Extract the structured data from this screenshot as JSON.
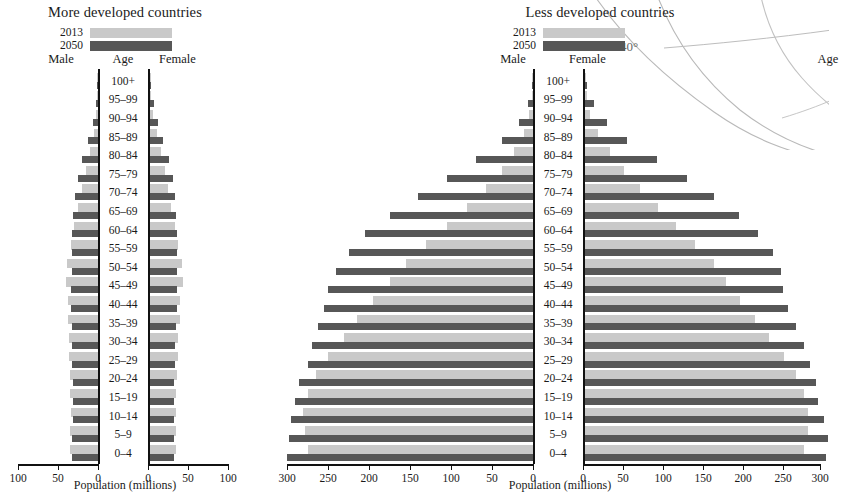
{
  "figure": {
    "panels": [
      {
        "id": "more-developed",
        "title": "More developed countries",
        "legend": [
          {
            "label": "2013",
            "color": "#c9c9c9"
          },
          {
            "label": "2050",
            "color": "#575757"
          }
        ],
        "col_headers": {
          "male": "Male",
          "age": "Age",
          "female": "Female"
        },
        "axis_title": "Population (millions)",
        "ticks": [
          "100",
          "50",
          "0"
        ],
        "ticks_right": [
          "0",
          "50",
          "100"
        ],
        "axis_max": 100
      },
      {
        "id": "less-developed",
        "title": "Less developed countries",
        "legend": [
          {
            "label": "2013",
            "color": "#c9c9c9"
          },
          {
            "label": "2050",
            "color": "#575757"
          }
        ],
        "col_headers": {
          "male": "Male",
          "age": "Age",
          "female": "Female"
        },
        "axis_title": "Population (millions)",
        "ticks": [
          "300",
          "250",
          "200",
          "150",
          "100",
          "50",
          "0"
        ],
        "ticks_right": [
          "0",
          "50",
          "100",
          "150",
          "200",
          "250",
          "300"
        ],
        "axis_max": 300
      }
    ],
    "map_annotation": {
      "label": "40°"
    }
  },
  "chart_data": [
    {
      "type": "bar",
      "id": "more-developed",
      "title": "More developed countries",
      "subtype": "population-pyramid",
      "xlabel": "Population (millions)",
      "ylabel": "Age",
      "xlim": [
        0,
        100
      ],
      "xticks": [
        0,
        50,
        100
      ],
      "grid": false,
      "legend": [
        "2013",
        "2050"
      ],
      "legend_position": "top-left",
      "categories": [
        "100+",
        "95–99",
        "90–94",
        "85–89",
        "80–84",
        "75–79",
        "70–74",
        "65–69",
        "60–64",
        "55–59",
        "50–54",
        "45–49",
        "40–44",
        "35–39",
        "30–34",
        "25–29",
        "20–24",
        "15–19",
        "10–14",
        "5–9",
        "0–4"
      ],
      "series": [
        {
          "name": "Male 2013",
          "side": "left",
          "year": 2013,
          "values": [
            0.1,
            0.7,
            2.2,
            5.2,
            10.5,
            15.5,
            19.5,
            24.5,
            29.5,
            33.5,
            38.5,
            40.5,
            37.5,
            37.0,
            36.0,
            36.5,
            35.0,
            34.5,
            34.0,
            34.5,
            34.5
          ]
        },
        {
          "name": "Male 2050",
          "side": "left",
          "year": 2050,
          "values": [
            0.8,
            2.6,
            6.5,
            12.5,
            19.5,
            25.5,
            29.0,
            31.5,
            32.5,
            33.0,
            33.0,
            33.5,
            34.0,
            33.0,
            32.5,
            32.0,
            31.5,
            31.5,
            31.5,
            32.0,
            32.0
          ]
        },
        {
          "name": "Female 2013",
          "side": "right",
          "year": 2013,
          "values": [
            0.3,
            1.8,
            4.6,
            8.7,
            14.5,
            19.0,
            22.5,
            27.0,
            31.5,
            35.0,
            40.0,
            41.5,
            38.5,
            37.5,
            36.0,
            36.0,
            34.0,
            33.0,
            32.5,
            33.0,
            33.0
          ]
        },
        {
          "name": "Female 2050",
          "side": "right",
          "year": 2050,
          "values": [
            2.2,
            5.5,
            10.5,
            17.0,
            24.0,
            29.0,
            31.5,
            33.5,
            34.0,
            34.0,
            34.0,
            34.0,
            34.0,
            33.0,
            32.0,
            31.5,
            30.5,
            30.0,
            30.0,
            30.5,
            30.5
          ]
        }
      ]
    },
    {
      "type": "bar",
      "id": "less-developed",
      "title": "Less developed countries",
      "subtype": "population-pyramid",
      "xlabel": "Population (millions)",
      "ylabel": "Age",
      "xlim": [
        0,
        300
      ],
      "xticks": [
        0,
        50,
        100,
        150,
        200,
        250,
        300
      ],
      "grid": false,
      "legend": [
        "2013",
        "2050"
      ],
      "legend_position": "top-left",
      "categories": [
        "100+",
        "95–99",
        "90–94",
        "85–89",
        "80–84",
        "75–79",
        "70–74",
        "65–69",
        "60–64",
        "55–59",
        "50–54",
        "45–49",
        "40–44",
        "35–39",
        "30–34",
        "25–29",
        "20–24",
        "15–19",
        "10–14",
        "5–9",
        "0–4"
      ],
      "series": [
        {
          "name": "Male 2013",
          "side": "left",
          "year": 2013,
          "values": [
            0.2,
            1.5,
            4.5,
            11,
            23,
            38,
            57,
            80,
            105,
            130,
            155,
            175,
            195,
            215,
            230,
            250,
            265,
            275,
            280,
            278,
            275
          ]
        },
        {
          "name": "Male 2050",
          "side": "left",
          "year": 2050,
          "values": [
            1.5,
            6,
            17,
            38,
            70,
            105,
            140,
            175,
            205,
            225,
            240,
            250,
            255,
            262,
            270,
            275,
            285,
            290,
            295,
            298,
            300
          ]
        },
        {
          "name": "Female 2013",
          "side": "right",
          "year": 2013,
          "values": [
            0.5,
            2.5,
            7,
            16,
            31,
            48,
            68,
            90,
            112,
            135,
            158,
            173,
            190,
            208,
            225,
            243,
            258,
            268,
            272,
            272,
            268
          ]
        },
        {
          "name": "Female 2050",
          "side": "right",
          "year": 2050,
          "values": [
            3,
            11,
            27,
            52,
            88,
            125,
            158,
            188,
            212,
            230,
            240,
            242,
            248,
            258,
            268,
            275,
            282,
            285,
            292,
            297,
            295
          ]
        }
      ]
    }
  ]
}
